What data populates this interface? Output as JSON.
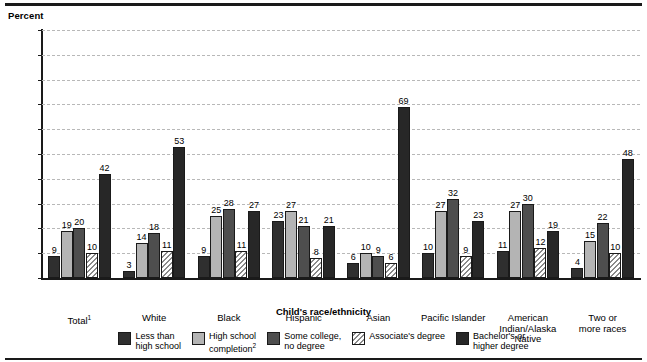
{
  "chart_data": {
    "type": "bar",
    "title": "",
    "xlabel": "Child's race/ethnicity",
    "ylabel": "Percent",
    "ylim": [
      0,
      100
    ],
    "ytick_step": 10,
    "yticks": [
      0,
      10,
      20,
      30,
      40,
      50,
      60,
      70,
      80,
      90,
      100
    ],
    "grid": true,
    "legend_position": "bottom",
    "categories": [
      "Total¹",
      "White",
      "Black",
      "Hispanic",
      "Asian",
      "Pacific Islander",
      "American\nIndian/Alaska\nNative",
      "Two or\nmore races"
    ],
    "series": [
      {
        "name": "Less than high school",
        "values": [
          9,
          3,
          9,
          23,
          6,
          10,
          11,
          4
        ]
      },
      {
        "name": "High school completion²",
        "values": [
          19,
          14,
          25,
          27,
          10,
          27,
          27,
          15
        ]
      },
      {
        "name": "Some college, no degree",
        "values": [
          20,
          18,
          28,
          21,
          9,
          32,
          30,
          22
        ]
      },
      {
        "name": "Associate's degree",
        "values": [
          10,
          11,
          11,
          8,
          6,
          9,
          12,
          10
        ]
      },
      {
        "name": "Bachelor's or higher degree",
        "values": [
          42,
          53,
          27,
          21,
          69,
          23,
          19,
          48
        ]
      }
    ]
  },
  "axis": {
    "y_title": "Percent",
    "x_title": "Child's race/ethnicity"
  },
  "legend": {
    "items": [
      {
        "label": "Less than\nhigh school",
        "fill": "f-lths",
        "color": "#2f2f2f"
      },
      {
        "label": "High school\ncompletion²",
        "fill": "f-hsc",
        "color": "#b4b4b4"
      },
      {
        "label": "Some college,\nno degree",
        "fill": "f-scnd",
        "color": "#4e4e4e"
      },
      {
        "label": "Associate's degree",
        "fill": "f-assoc",
        "color": "#ffffff"
      },
      {
        "label": "Bachelor's or\nhigher degree",
        "fill": "f-bach",
        "color": "#272727"
      }
    ]
  },
  "colors": {
    "rule": "#1a1a1a",
    "gridline": "#b8b8b8",
    "background": "#ffffff"
  }
}
